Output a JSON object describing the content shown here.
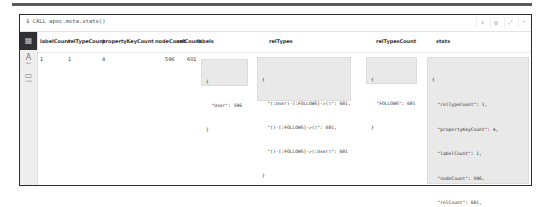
{
  "command": "$ CALL apoc.meta.stats()",
  "actions": [
    {
      "name": "pin-icon",
      "glyph": "⍋"
    },
    {
      "name": "settings-icon",
      "glyph": "⚙"
    },
    {
      "name": "expand-icon",
      "glyph": "⤢"
    },
    {
      "name": "collapse-icon",
      "glyph": "⌃"
    }
  ],
  "sidebar": {
    "items": [
      {
        "label": "Table",
        "glyph": "▦",
        "active": true
      },
      {
        "label": "Text",
        "glyph": "A",
        "active": false
      },
      {
        "label": "Code",
        "glyph": "▭",
        "active": false
      }
    ]
  },
  "table": {
    "headers": [
      "labelCount",
      "relTypeCount",
      "propertyKeyCount",
      "nodeCount",
      "relCount",
      "labels",
      "relTypes",
      "relTypesCount",
      "stats"
    ],
    "row": {
      "labelCount": "1",
      "relTypeCount": "1",
      "propertyKeyCount": "4",
      "nodeCount": "596",
      "relCount": "601",
      "labels": [
        "{",
        "  \"User\": 596",
        "}"
      ],
      "relTypes": [
        "{",
        "  \"(:User)-[:FOLLOWS]->()\": 601,",
        "  \"()-[:FOLLOWS]->()\": 601,",
        "  \"()-[:FOLLOWS]->(:User)\": 601",
        "}"
      ],
      "relTypesCount": [
        "{",
        "  \"FOLLOWS\": 601",
        "}"
      ],
      "stats": [
        "{",
        "  \"relTypeCount\": 1,",
        "  \"propertyKeyCount\": 4,",
        "  \"labelCount\": 1,",
        "  \"nodeCount\": 596,",
        "  \"relCount\": 601,",
        "  \"labels\": {",
        "    \"User\": 596",
        "  },",
        "  \"relTypes\": {",
        "    \"(:User)-[:FOLLOWS]->()\": 601,",
        "    \"()-[:FOLLOWS]->()\": 601,",
        "    \"()-[:FOLLOWS]->(:User)\": 601",
        "  }",
        "}"
      ]
    }
  }
}
